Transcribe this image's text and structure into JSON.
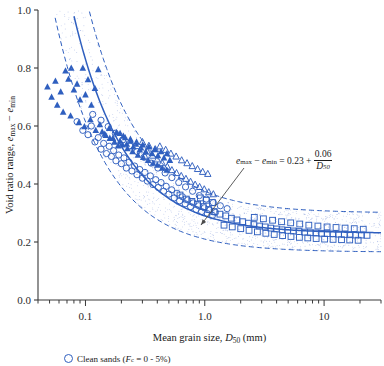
{
  "chart_data": {
    "type": "scatter",
    "title": "",
    "xlabel": "Mean grain size, D50 (mm)",
    "ylabel": "Void ratio range, emax - emin",
    "xscale": "log",
    "yscale": "linear",
    "xlim": [
      0.04,
      30
    ],
    "ylim": [
      0.0,
      1.0
    ],
    "xticks": [
      "0.1",
      "1.0",
      "10"
    ],
    "xtick_values": [
      0.1,
      1.0,
      10
    ],
    "yticks": [
      "0.0",
      "0.2",
      "0.4",
      "0.6",
      "0.8",
      "1.0"
    ],
    "ytick_values": [
      0.0,
      0.2,
      0.4,
      0.6,
      0.8,
      1.0
    ],
    "grid": false,
    "legend_position": "below-axes",
    "annotation": {
      "equation": "emax - emin = 0.23 + 0.06/D50",
      "lhs_left": "e",
      "lhs_left_sub": "max",
      "minus": "−",
      "lhs_right": "e",
      "lhs_right_sub": "min",
      "equals": "=",
      "intercept": "0.23",
      "plus": "+",
      "numerator": "0.06",
      "denominator": "D",
      "denominator_sub": "50",
      "arrow_color": "#4a4a4a"
    },
    "fit_curve": {
      "name": "best-fit",
      "formula": "0.23 + 0.06/D50",
      "style": "solid",
      "color": "#2f5fbf"
    },
    "bounds": [
      {
        "name": "upper-bound",
        "formula": "0.30 + 0.075/D50",
        "style": "dashed",
        "color": "#2f5fbf"
      },
      {
        "name": "lower-bound",
        "formula": "0.165 + 0.045/D50",
        "style": "dashed",
        "color": "#2f5fbf"
      }
    ],
    "series": [
      {
        "name": "Clean sands",
        "marker": "open-circle",
        "color": "#2f5fbf",
        "points": [
          [
            0.085,
            0.615
          ],
          [
            0.095,
            0.585
          ],
          [
            0.105,
            0.57
          ],
          [
            0.112,
            0.6
          ],
          [
            0.12,
            0.545
          ],
          [
            0.128,
            0.56
          ],
          [
            0.135,
            0.52
          ],
          [
            0.142,
            0.54
          ],
          [
            0.15,
            0.505
          ],
          [
            0.158,
            0.53
          ],
          [
            0.165,
            0.495
          ],
          [
            0.172,
            0.515
          ],
          [
            0.18,
            0.48
          ],
          [
            0.19,
            0.5
          ],
          [
            0.2,
            0.47
          ],
          [
            0.21,
            0.49
          ],
          [
            0.22,
            0.455
          ],
          [
            0.232,
            0.475
          ],
          [
            0.245,
            0.445
          ],
          [
            0.258,
            0.462
          ],
          [
            0.27,
            0.432
          ],
          [
            0.285,
            0.45
          ],
          [
            0.3,
            0.42
          ],
          [
            0.315,
            0.44
          ],
          [
            0.33,
            0.41
          ],
          [
            0.35,
            0.428
          ],
          [
            0.368,
            0.398
          ],
          [
            0.388,
            0.415
          ],
          [
            0.408,
            0.388
          ],
          [
            0.43,
            0.405
          ],
          [
            0.452,
            0.375
          ],
          [
            0.475,
            0.392
          ],
          [
            0.5,
            0.365
          ],
          [
            0.528,
            0.38
          ],
          [
            0.555,
            0.352
          ],
          [
            0.585,
            0.368
          ],
          [
            0.615,
            0.342
          ],
          [
            0.65,
            0.356
          ],
          [
            0.685,
            0.332
          ],
          [
            0.72,
            0.345
          ],
          [
            0.76,
            0.322
          ],
          [
            0.8,
            0.335
          ],
          [
            0.845,
            0.312
          ],
          [
            0.89,
            0.325
          ],
          [
            0.94,
            0.305
          ],
          [
            0.99,
            0.318
          ],
          [
            1.05,
            0.298
          ],
          [
            1.1,
            0.31
          ],
          [
            1.16,
            0.292
          ],
          [
            1.23,
            0.302
          ],
          [
            0.115,
            0.64
          ],
          [
            0.135,
            0.62
          ],
          [
            0.155,
            0.598
          ],
          [
            0.178,
            0.575
          ],
          [
            0.205,
            0.552
          ],
          [
            0.235,
            0.532
          ],
          [
            0.27,
            0.512
          ],
          [
            0.31,
            0.492
          ],
          [
            0.355,
            0.472
          ],
          [
            0.405,
            0.455
          ],
          [
            0.465,
            0.438
          ],
          [
            0.53,
            0.422
          ],
          [
            0.605,
            0.405
          ],
          [
            0.69,
            0.39
          ],
          [
            0.79,
            0.375
          ],
          [
            0.9,
            0.36
          ],
          [
            1.03,
            0.348
          ],
          [
            1.18,
            0.336
          ],
          [
            1.35,
            0.325
          ],
          [
            1.54,
            0.315
          ]
        ]
      },
      {
        "name": "Sands with fines",
        "marker": "filled-triangle",
        "color": "#2f5fbf",
        "points": [
          [
            0.048,
            0.735
          ],
          [
            0.052,
            0.7
          ],
          [
            0.056,
            0.755
          ],
          [
            0.058,
            0.672
          ],
          [
            0.062,
            0.718
          ],
          [
            0.068,
            0.79
          ],
          [
            0.072,
            0.762
          ],
          [
            0.076,
            0.8
          ],
          [
            0.08,
            0.725
          ],
          [
            0.085,
            0.745
          ],
          [
            0.09,
            0.69
          ],
          [
            0.095,
            0.8
          ],
          [
            0.1,
            0.708
          ],
          [
            0.105,
            0.76
          ],
          [
            0.112,
            0.672
          ],
          [
            0.12,
            0.73
          ],
          [
            0.128,
            0.795
          ],
          [
            0.065,
            0.648
          ],
          [
            0.075,
            0.635
          ],
          [
            0.088,
            0.612
          ],
          [
            0.098,
            0.598
          ],
          [
            0.11,
            0.622
          ],
          [
            0.122,
            0.585
          ],
          [
            0.132,
            0.605
          ],
          [
            0.145,
            0.572
          ],
          [
            0.158,
            0.592
          ],
          [
            0.17,
            0.558
          ],
          [
            0.182,
            0.578
          ],
          [
            0.195,
            0.548
          ],
          [
            0.208,
            0.565
          ],
          [
            0.222,
            0.538
          ],
          [
            0.238,
            0.555
          ],
          [
            0.252,
            0.528
          ],
          [
            0.268,
            0.545
          ],
          [
            0.285,
            0.518
          ],
          [
            0.302,
            0.535
          ],
          [
            0.32,
            0.512
          ],
          [
            0.34,
            0.528
          ],
          [
            0.36,
            0.505
          ],
          [
            0.382,
            0.52
          ],
          [
            0.405,
            0.498
          ],
          [
            0.43,
            0.512
          ],
          [
            0.455,
            0.49
          ],
          [
            0.482,
            0.505
          ],
          [
            0.51,
            0.482
          ],
          [
            0.195,
            0.575
          ],
          [
            0.215,
            0.56
          ],
          [
            0.24,
            0.548
          ],
          [
            0.265,
            0.538
          ],
          [
            0.292,
            0.525
          ],
          [
            0.205,
            0.535
          ],
          [
            0.225,
            0.522
          ],
          [
            0.248,
            0.512
          ],
          [
            0.275,
            0.5
          ],
          [
            0.305,
            0.492
          ],
          [
            0.335,
            0.482
          ],
          [
            0.368,
            0.472
          ],
          [
            0.4,
            0.465
          ],
          [
            0.44,
            0.455
          ],
          [
            0.48,
            0.448
          ],
          [
            0.175,
            0.545
          ],
          [
            0.188,
            0.532
          ],
          [
            0.16,
            0.558
          ],
          [
            0.148,
            0.568
          ],
          [
            0.138,
            0.58
          ]
        ]
      },
      {
        "name": "Open triangles",
        "marker": "open-triangle",
        "color": "#2f5fbf",
        "points": [
          [
            0.33,
            0.512
          ],
          [
            0.365,
            0.498
          ],
          [
            0.4,
            0.485
          ],
          [
            0.44,
            0.472
          ],
          [
            0.485,
            0.46
          ],
          [
            0.53,
            0.448
          ],
          [
            0.58,
            0.438
          ],
          [
            0.635,
            0.428
          ],
          [
            0.695,
            0.418
          ],
          [
            0.76,
            0.408
          ],
          [
            0.83,
            0.398
          ],
          [
            0.905,
            0.39
          ],
          [
            0.99,
            0.382
          ],
          [
            1.08,
            0.372
          ],
          [
            1.18,
            0.365
          ],
          [
            0.42,
            0.53
          ],
          [
            0.47,
            0.518
          ],
          [
            0.52,
            0.505
          ],
          [
            0.575,
            0.495
          ],
          [
            0.64,
            0.482
          ],
          [
            0.71,
            0.472
          ],
          [
            0.785,
            0.462
          ],
          [
            0.87,
            0.452
          ],
          [
            0.96,
            0.442
          ],
          [
            1.06,
            0.435
          ],
          [
            0.3,
            0.545
          ],
          [
            0.34,
            0.532
          ],
          [
            0.385,
            0.52
          ]
        ]
      },
      {
        "name": "Open squares",
        "marker": "open-square",
        "color": "#2f5fbf",
        "points": [
          [
            0.62,
            0.362
          ],
          [
            0.7,
            0.348
          ],
          [
            0.78,
            0.34
          ],
          [
            0.87,
            0.33
          ],
          [
            0.97,
            0.322
          ],
          [
            1.08,
            0.312
          ],
          [
            1.2,
            0.305
          ],
          [
            1.34,
            0.296
          ],
          [
            1.5,
            0.29
          ],
          [
            1.67,
            0.282
          ],
          [
            1.86,
            0.276
          ],
          [
            2.08,
            0.27
          ],
          [
            2.32,
            0.265
          ],
          [
            2.58,
            0.26
          ],
          [
            2.88,
            0.255
          ],
          [
            3.21,
            0.252
          ],
          [
            3.58,
            0.248
          ],
          [
            3.99,
            0.245
          ],
          [
            4.45,
            0.242
          ],
          [
            4.96,
            0.24
          ],
          [
            5.53,
            0.238
          ],
          [
            6.17,
            0.236
          ],
          [
            6.88,
            0.234
          ],
          [
            7.67,
            0.232
          ],
          [
            8.55,
            0.231
          ],
          [
            9.54,
            0.23
          ],
          [
            10.6,
            0.229
          ],
          [
            11.9,
            0.228
          ],
          [
            13.2,
            0.227
          ],
          [
            14.8,
            0.226
          ],
          [
            16.5,
            0.225
          ],
          [
            18.4,
            0.224
          ],
          [
            20.5,
            0.224
          ],
          [
            22.9,
            0.223
          ],
          [
            1.45,
            0.258
          ],
          [
            1.7,
            0.252
          ],
          [
            2.0,
            0.246
          ],
          [
            2.35,
            0.24
          ],
          [
            2.76,
            0.235
          ],
          [
            3.25,
            0.23
          ],
          [
            3.82,
            0.226
          ],
          [
            4.49,
            0.222
          ],
          [
            5.28,
            0.219
          ],
          [
            6.21,
            0.216
          ],
          [
            7.3,
            0.214
          ],
          [
            8.58,
            0.212
          ],
          [
            10.1,
            0.21
          ],
          [
            11.9,
            0.209
          ],
          [
            14.0,
            0.208
          ],
          [
            16.4,
            0.207
          ],
          [
            19.3,
            0.206
          ],
          [
            2.6,
            0.285
          ],
          [
            3.1,
            0.28
          ],
          [
            3.7,
            0.275
          ],
          [
            4.4,
            0.27
          ],
          [
            5.25,
            0.266
          ],
          [
            6.25,
            0.262
          ],
          [
            7.45,
            0.258
          ],
          [
            8.88,
            0.255
          ],
          [
            10.6,
            0.252
          ],
          [
            12.6,
            0.25
          ],
          [
            15.0,
            0.248
          ],
          [
            17.9,
            0.246
          ],
          [
            21.3,
            0.244
          ],
          [
            0.92,
            0.352
          ],
          [
            1.03,
            0.344
          ],
          [
            1.16,
            0.336
          ]
        ]
      }
    ],
    "legend": [
      {
        "marker": "open-circle",
        "label_prefix": "Clean sands (",
        "label_sym": "F",
        "label_sub": "c",
        "label_suffix": " = 0 - 5%)"
      }
    ]
  }
}
